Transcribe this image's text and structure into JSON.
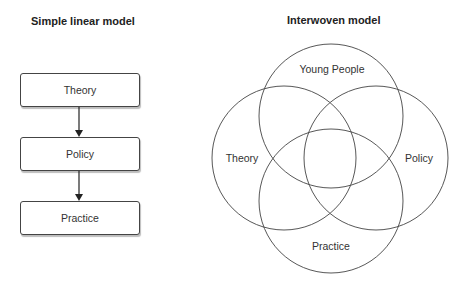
{
  "left_panel": {
    "title": "Simple linear model",
    "boxes": [
      {
        "label": "Theory"
      },
      {
        "label": "Policy"
      },
      {
        "label": "Practice"
      }
    ],
    "arrows": [
      {
        "from": "Theory",
        "to": "Policy"
      },
      {
        "from": "Policy",
        "to": "Practice"
      }
    ]
  },
  "right_panel": {
    "title": "Interwoven model",
    "circles": [
      {
        "label": "Young People",
        "position": "top"
      },
      {
        "label": "Theory",
        "position": "left"
      },
      {
        "label": "Policy",
        "position": "right"
      },
      {
        "label": "Practice",
        "position": "bottom"
      }
    ]
  },
  "colors": {
    "stroke": "#444444",
    "text": "#222222",
    "shadow": "#bdbdbd"
  }
}
